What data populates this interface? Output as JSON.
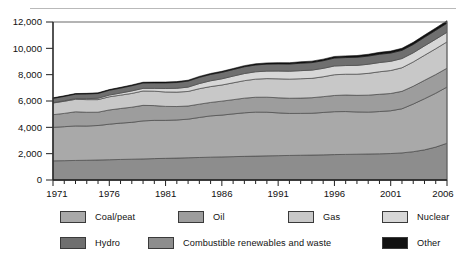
{
  "chart_data": {
    "type": "area",
    "stacked": true,
    "title": "",
    "xlabel": "",
    "ylabel": "",
    "xlim": [
      1971,
      2006
    ],
    "ylim": [
      0,
      12000
    ],
    "ytick_values": [
      0,
      2000,
      4000,
      6000,
      8000,
      10000,
      12000
    ],
    "ytick_labels": [
      "0",
      "2,000",
      "4,000",
      "6,000",
      "8,000",
      "10,000",
      "12,000"
    ],
    "xtick_values": [
      1971,
      1976,
      1981,
      1986,
      1991,
      1996,
      2001,
      2006
    ],
    "xtick_labels": [
      "1971",
      "1976",
      "1981",
      "1986",
      "1991",
      "1996",
      "2001",
      "2006"
    ],
    "minor_xticks": true,
    "grid": false,
    "legend_position": "bottom",
    "x": [
      1971,
      1972,
      1973,
      1974,
      1975,
      1976,
      1977,
      1978,
      1979,
      1980,
      1981,
      1982,
      1983,
      1984,
      1985,
      1986,
      1987,
      1988,
      1989,
      1990,
      1991,
      1992,
      1993,
      1994,
      1995,
      1996,
      1997,
      1998,
      1999,
      2000,
      2001,
      2002,
      2003,
      2004,
      2005,
      2006
    ],
    "stack_order_bottom_to_top": [
      "Combustible renewables and waste",
      "Coal/peat",
      "Oil",
      "Gas",
      "Nuclear",
      "Hydro",
      "Other"
    ],
    "series": [
      {
        "name": "Combustible renewables and waste",
        "color": "#8d8d8d",
        "values": [
          1455,
          1470,
          1485,
          1500,
          1520,
          1540,
          1560,
          1580,
          1600,
          1625,
          1645,
          1665,
          1690,
          1710,
          1735,
          1755,
          1775,
          1795,
          1815,
          1835,
          1850,
          1865,
          1880,
          1895,
          1910,
          1930,
          1945,
          1960,
          1975,
          1990,
          2010,
          2060,
          2150,
          2290,
          2500,
          2790
        ]
      },
      {
        "name": "Coal/peat",
        "color": "#a9a9a9",
        "values": [
          2545,
          2580,
          2620,
          2600,
          2620,
          2700,
          2760,
          2800,
          2890,
          2905,
          2885,
          2895,
          2930,
          3040,
          3135,
          3175,
          3245,
          3310,
          3340,
          3315,
          3250,
          3190,
          3180,
          3175,
          3220,
          3260,
          3255,
          3210,
          3180,
          3210,
          3250,
          3350,
          3620,
          3880,
          4090,
          4270
        ]
      },
      {
        "name": "Oil",
        "color": "#9d9d9d",
        "values": [
          960,
          1010,
          1075,
          1045,
          1010,
          1080,
          1110,
          1150,
          1180,
          1120,
          1060,
          1020,
          1000,
          1010,
          1020,
          1060,
          1080,
          1110,
          1130,
          1140,
          1145,
          1155,
          1160,
          1180,
          1200,
          1230,
          1255,
          1260,
          1290,
          1310,
          1310,
          1325,
          1350,
          1400,
          1420,
          1430
        ]
      },
      {
        "name": "Gas",
        "color": "#c8c8c8",
        "values": [
          890,
          920,
          950,
          960,
          955,
          1000,
          1015,
          1045,
          1090,
          1095,
          1095,
          1095,
          1105,
          1175,
          1205,
          1225,
          1280,
          1330,
          1375,
          1410,
          1440,
          1450,
          1470,
          1470,
          1510,
          1575,
          1580,
          1605,
          1655,
          1710,
          1745,
          1790,
          1845,
          1900,
          1960,
          2000
        ]
      },
      {
        "name": "Nuclear",
        "color": "#d7d7d7",
        "values": [
          29,
          40,
          53,
          73,
          105,
          130,
          160,
          190,
          200,
          215,
          265,
          290,
          330,
          390,
          440,
          470,
          510,
          540,
          560,
          570,
          590,
          600,
          615,
          625,
          640,
          665,
          660,
          670,
          690,
          700,
          700,
          700,
          695,
          715,
          725,
          730
        ]
      },
      {
        "name": "Hydro",
        "color": "#6f6f6f",
        "values": [
          320,
          330,
          335,
          355,
          360,
          365,
          375,
          395,
          405,
          415,
          425,
          440,
          455,
          470,
          480,
          490,
          495,
          515,
          515,
          530,
          540,
          545,
          565,
          570,
          580,
          600,
          605,
          615,
          620,
          630,
          625,
          620,
          630,
          650,
          670,
          690
        ]
      },
      {
        "name": "Other",
        "color": "#111111",
        "values": [
          42,
          44,
          46,
          48,
          50,
          52,
          55,
          58,
          60,
          62,
          65,
          68,
          70,
          73,
          76,
          79,
          82,
          86,
          90,
          94,
          98,
          102,
          107,
          112,
          117,
          122,
          127,
          133,
          139,
          145,
          151,
          158,
          165,
          172,
          180,
          188
        ]
      }
    ]
  },
  "legend": {
    "items": [
      {
        "label": "Coal/peat",
        "color": "#a9a9a9"
      },
      {
        "label": "Oil",
        "color": "#9d9d9d"
      },
      {
        "label": "Gas",
        "color": "#c8c8c8"
      },
      {
        "label": "Nuclear",
        "color": "#d7d7d7"
      },
      {
        "label": "Hydro",
        "color": "#6f6f6f"
      },
      {
        "label": "Combustible renewables and waste",
        "color": "#8d8d8d"
      },
      {
        "label": "Other",
        "color": "#111111"
      }
    ]
  }
}
